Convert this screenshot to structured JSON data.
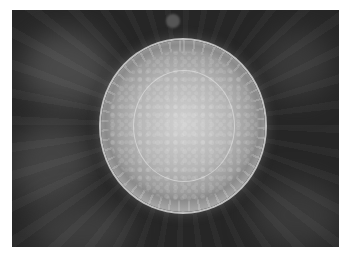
{
  "image": {
    "description": "Grayscale microscopy photograph of a circular disc-shaped specimen with a radially striated outer rim and granular inner core on a dark blurred background",
    "colors": {
      "background": "#262626",
      "disc_center": "#c9c9c9",
      "disc_rim": "#8a8a8a",
      "border": "#ffffff"
    }
  }
}
